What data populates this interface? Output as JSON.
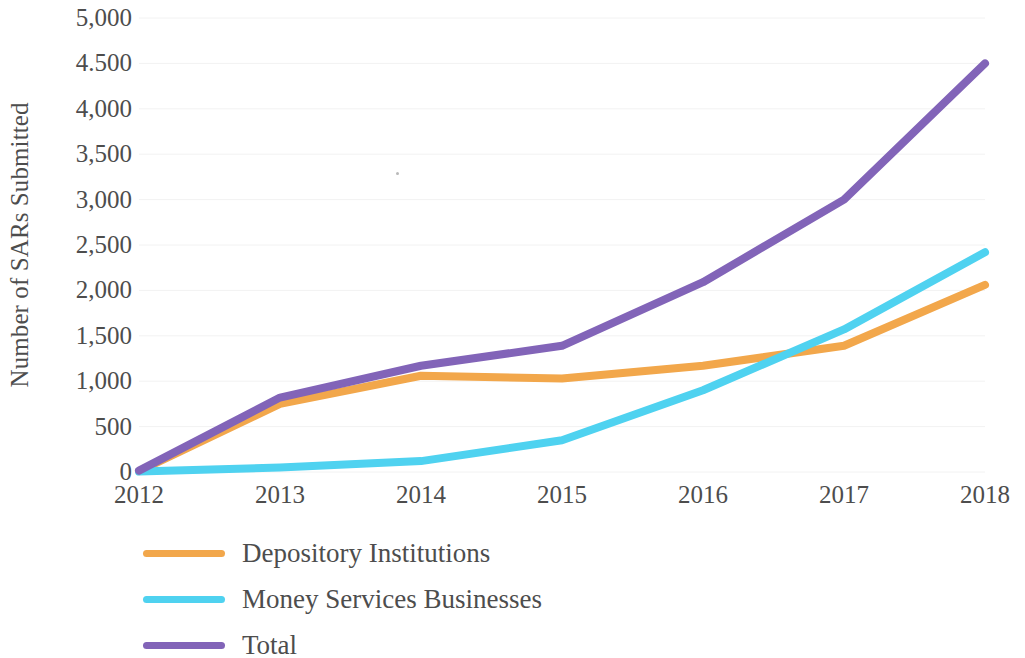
{
  "chart_data": {
    "type": "line",
    "title": "",
    "xlabel": "",
    "ylabel": "Number of SARs Submitted",
    "x": [
      2012,
      2013,
      2014,
      2015,
      2016,
      2017,
      2018
    ],
    "categories": [
      "2012",
      "2013",
      "2014",
      "2015",
      "2016",
      "2017",
      "2018"
    ],
    "xtick_labels": [
      "2012",
      "2013",
      "2014",
      "2015",
      "2016",
      "2017",
      "2018"
    ],
    "ytick_labels": [
      "0",
      "500",
      "1,000",
      "1,500",
      "2,000",
      "2,500",
      "3,000",
      "3,500",
      "4,000",
      "4.500",
      "5,000"
    ],
    "ytick_values": [
      0,
      500,
      1000,
      1500,
      2000,
      2500,
      3000,
      3500,
      4000,
      4500,
      5000
    ],
    "ylim": [
      0,
      5000
    ],
    "xlim": [
      2012,
      2018
    ],
    "grid": true,
    "grid_axis": "y",
    "grid_color": "#f2f2f2",
    "legend_position": "bottom-left",
    "series": [
      {
        "name": "Depository Institutions",
        "color": "#f2a74b",
        "values": [
          10,
          750,
          1060,
          1030,
          1170,
          1390,
          2060
        ]
      },
      {
        "name": "Money Services Businesses",
        "color": "#4fd2f0",
        "values": [
          5,
          50,
          120,
          350,
          900,
          1570,
          2420
        ]
      },
      {
        "name": "Total",
        "color": "#8264b8",
        "values": [
          15,
          820,
          1170,
          1390,
          2090,
          3000,
          4500
        ]
      }
    ]
  },
  "legend": {
    "items": [
      {
        "label": "Depository Institutions",
        "color": "#f2a74b"
      },
      {
        "label": "Money Services Businesses",
        "color": "#4fd2f0"
      },
      {
        "label": "Total",
        "color": "#8264b8"
      }
    ]
  }
}
